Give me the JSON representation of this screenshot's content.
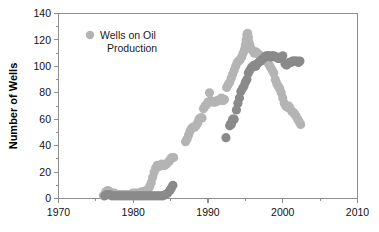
{
  "chart_data": {
    "type": "scatter",
    "title": "",
    "xlabel": "",
    "ylabel": "Number of Wells",
    "xlim": [
      1970,
      2010
    ],
    "ylim": [
      0,
      140
    ],
    "grid": false,
    "legend_position": "top-left",
    "x_ticks": [
      1970,
      1980,
      1990,
      2000,
      2010
    ],
    "x_tick_labels": [
      "1970",
      "1980",
      "1990",
      "2000",
      "2010"
    ],
    "x_minor_ticks": [
      1975,
      1985,
      1995,
      2005
    ],
    "y_ticks": [
      0,
      20,
      40,
      60,
      80,
      100,
      120,
      140
    ],
    "y_tick_labels": [
      "0",
      "20",
      "40",
      "60",
      "80",
      "100",
      "120",
      "140"
    ],
    "legend": [
      {
        "label": "Wells on Oil Production",
        "color": "#b4b4b4",
        "marker": "circle"
      }
    ],
    "series": [
      {
        "name": "Wells on Oil Production",
        "color": "#b4b4b4",
        "marker": "circle",
        "marker_size": 4.6,
        "points": [
          [
            1976.0,
            2
          ],
          [
            1976.3,
            5
          ],
          [
            1976.6,
            6
          ],
          [
            1976.9,
            5
          ],
          [
            1977.2,
            4
          ],
          [
            1977.5,
            4
          ],
          [
            1977.8,
            3
          ],
          [
            1978.1,
            3
          ],
          [
            1978.4,
            3
          ],
          [
            1978.7,
            3
          ],
          [
            1979.0,
            3
          ],
          [
            1979.3,
            3
          ],
          [
            1979.6,
            3
          ],
          [
            1979.9,
            4
          ],
          [
            1980.2,
            4
          ],
          [
            1980.5,
            4
          ],
          [
            1980.8,
            4
          ],
          [
            1981.1,
            5
          ],
          [
            1981.4,
            5
          ],
          [
            1981.7,
            6
          ],
          [
            1982.0,
            7
          ],
          [
            1982.2,
            9
          ],
          [
            1982.4,
            12
          ],
          [
            1982.6,
            16
          ],
          [
            1982.8,
            20
          ],
          [
            1983.0,
            23
          ],
          [
            1983.2,
            25
          ],
          [
            1983.4,
            24
          ],
          [
            1983.6,
            25
          ],
          [
            1983.8,
            26
          ],
          [
            1984.0,
            25
          ],
          [
            1984.2,
            25
          ],
          [
            1984.4,
            26
          ],
          [
            1984.6,
            27
          ],
          [
            1984.8,
            28
          ],
          [
            1985.0,
            30
          ],
          [
            1985.2,
            31
          ],
          [
            1985.4,
            31
          ],
          [
            1987.0,
            43
          ],
          [
            1987.2,
            45
          ],
          [
            1987.4,
            48
          ],
          [
            1987.6,
            51
          ],
          [
            1987.8,
            53
          ],
          [
            1988.0,
            54
          ],
          [
            1988.2,
            54
          ],
          [
            1988.4,
            55
          ],
          [
            1988.6,
            57
          ],
          [
            1988.8,
            60
          ],
          [
            1989.0,
            61
          ],
          [
            1989.2,
            61
          ],
          [
            1989.4,
            68
          ],
          [
            1989.6,
            70
          ],
          [
            1989.8,
            71
          ],
          [
            1990.0,
            73
          ],
          [
            1990.2,
            80
          ],
          [
            1990.4,
            74
          ],
          [
            1990.6,
            73
          ],
          [
            1990.8,
            73
          ],
          [
            1991.0,
            73
          ],
          [
            1991.2,
            74
          ],
          [
            1991.4,
            74
          ],
          [
            1991.6,
            75
          ],
          [
            1991.8,
            76
          ],
          [
            1992.0,
            74
          ],
          [
            1992.2,
            75
          ],
          [
            1992.5,
            84
          ],
          [
            1992.7,
            86
          ],
          [
            1992.9,
            88
          ],
          [
            1993.1,
            91
          ],
          [
            1993.3,
            94
          ],
          [
            1993.5,
            97
          ],
          [
            1993.7,
            100
          ],
          [
            1993.9,
            103
          ],
          [
            1994.1,
            104
          ],
          [
            1994.3,
            105
          ],
          [
            1994.5,
            107
          ],
          [
            1994.7,
            110
          ],
          [
            1994.9,
            113
          ],
          [
            1995.0,
            116
          ],
          [
            1995.1,
            120
          ],
          [
            1995.2,
            124
          ],
          [
            1995.3,
            125
          ],
          [
            1995.4,
            122
          ],
          [
            1995.5,
            118
          ],
          [
            1995.6,
            116
          ],
          [
            1995.8,
            113
          ],
          [
            1996.0,
            112
          ],
          [
            1996.2,
            110
          ],
          [
            1996.4,
            111
          ],
          [
            1996.6,
            110
          ],
          [
            1996.8,
            109
          ],
          [
            1997.0,
            108
          ],
          [
            1997.2,
            107
          ],
          [
            1997.4,
            106
          ],
          [
            1997.6,
            105
          ],
          [
            1997.8,
            104
          ],
          [
            1998.0,
            103
          ],
          [
            1998.2,
            101
          ],
          [
            1998.4,
            99
          ],
          [
            1998.6,
            97
          ],
          [
            1998.8,
            95
          ],
          [
            1999.0,
            90
          ],
          [
            1999.2,
            87
          ],
          [
            1999.4,
            85
          ],
          [
            1999.6,
            83
          ],
          [
            1999.8,
            80
          ],
          [
            2000.0,
            76
          ],
          [
            2000.2,
            72
          ],
          [
            2000.4,
            70
          ],
          [
            2000.6,
            69
          ],
          [
            2000.8,
            70
          ],
          [
            2001.0,
            68
          ],
          [
            2001.2,
            66
          ],
          [
            2001.4,
            65
          ],
          [
            2001.6,
            64
          ],
          [
            2001.8,
            62
          ],
          [
            2002.0,
            60
          ],
          [
            2002.2,
            58
          ],
          [
            2002.4,
            56
          ]
        ]
      },
      {
        "name": "Wells on Gas Production",
        "color": "#8a8a8a",
        "marker": "circle",
        "marker_size": 4.6,
        "points": [
          [
            1976.2,
            2
          ],
          [
            1976.5,
            3
          ],
          [
            1976.8,
            3
          ],
          [
            1977.1,
            2
          ],
          [
            1977.4,
            2
          ],
          [
            1977.7,
            2
          ],
          [
            1978.0,
            2
          ],
          [
            1978.3,
            2
          ],
          [
            1978.6,
            2
          ],
          [
            1978.9,
            2
          ],
          [
            1979.2,
            2
          ],
          [
            1979.5,
            2
          ],
          [
            1979.8,
            2
          ],
          [
            1980.1,
            2
          ],
          [
            1980.4,
            2
          ],
          [
            1980.7,
            2
          ],
          [
            1981.0,
            2
          ],
          [
            1981.3,
            2
          ],
          [
            1981.6,
            2
          ],
          [
            1981.9,
            2
          ],
          [
            1982.2,
            2
          ],
          [
            1982.5,
            2
          ],
          [
            1982.8,
            2
          ],
          [
            1983.1,
            2
          ],
          [
            1983.4,
            2
          ],
          [
            1983.7,
            2
          ],
          [
            1984.0,
            2
          ],
          [
            1984.3,
            3
          ],
          [
            1984.6,
            4
          ],
          [
            1984.9,
            6
          ],
          [
            1985.1,
            8
          ],
          [
            1985.3,
            10
          ],
          [
            1992.4,
            46
          ],
          [
            1992.9,
            55
          ],
          [
            1993.0,
            56
          ],
          [
            1993.1,
            56
          ],
          [
            1993.2,
            58
          ],
          [
            1993.3,
            60
          ],
          [
            1993.5,
            60
          ],
          [
            1993.8,
            67
          ],
          [
            1994.0,
            72
          ],
          [
            1994.2,
            76
          ],
          [
            1994.4,
            81
          ],
          [
            1994.6,
            83
          ],
          [
            1994.8,
            85
          ],
          [
            1995.0,
            88
          ],
          [
            1995.2,
            90
          ],
          [
            1995.4,
            95
          ],
          [
            1995.6,
            97
          ],
          [
            1995.8,
            99
          ],
          [
            1996.0,
            100
          ],
          [
            1996.2,
            101
          ],
          [
            1996.4,
            100
          ],
          [
            1996.6,
            102
          ],
          [
            1996.8,
            103
          ],
          [
            1997.0,
            104
          ],
          [
            1997.2,
            105
          ],
          [
            1997.4,
            106
          ],
          [
            1997.6,
            107
          ],
          [
            1997.8,
            108
          ],
          [
            1998.0,
            108
          ],
          [
            1998.2,
            108
          ],
          [
            1998.4,
            107
          ],
          [
            1998.6,
            108
          ],
          [
            1998.8,
            108
          ],
          [
            1999.0,
            107
          ],
          [
            1999.2,
            107
          ],
          [
            1999.4,
            106
          ],
          [
            1999.6,
            106
          ],
          [
            1999.8,
            107
          ],
          [
            2000.0,
            108
          ],
          [
            2000.3,
            102
          ],
          [
            2000.5,
            101
          ],
          [
            2000.7,
            102
          ],
          [
            2000.9,
            103
          ],
          [
            2001.1,
            103
          ],
          [
            2001.3,
            104
          ],
          [
            2001.5,
            104
          ],
          [
            2001.7,
            104
          ],
          [
            2001.9,
            104
          ],
          [
            2002.1,
            103
          ],
          [
            2002.3,
            104
          ]
        ]
      }
    ]
  },
  "legend_block": {
    "line1": "Wells on Oil",
    "line2": "Production"
  }
}
